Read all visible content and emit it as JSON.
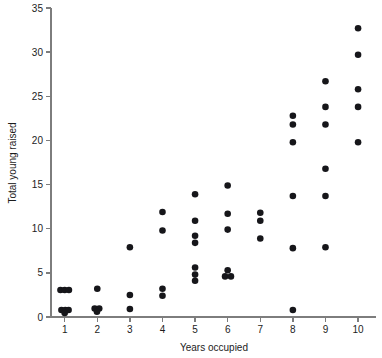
{
  "chart_data": {
    "type": "scatter",
    "title": "",
    "xlabel": "Years occupied",
    "ylabel": "Total young raised",
    "xlim": [
      0.35,
      10.55
    ],
    "ylim": [
      0,
      35
    ],
    "xticks": [
      1,
      2,
      3,
      4,
      5,
      6,
      7,
      8,
      9,
      10
    ],
    "xtick_labels": [
      "1",
      "2",
      "3",
      "4",
      "5",
      "6",
      "7",
      "8",
      "9",
      "10"
    ],
    "yticks": [
      0,
      5,
      10,
      15,
      20,
      25,
      30,
      35
    ],
    "ytick_labels": [
      "0",
      "5",
      "10",
      "15",
      "20",
      "25",
      "30",
      "35"
    ],
    "grid": false,
    "legend": "none",
    "marker": "filled-circle",
    "marker_color": "#16161a",
    "marker_size": 3.3,
    "points": [
      {
        "x": 0.87,
        "y": 3.05
      },
      {
        "x": 1.0,
        "y": 3.05
      },
      {
        "x": 1.13,
        "y": 3.05
      },
      {
        "x": 0.9,
        "y": 0.8
      },
      {
        "x": 1.02,
        "y": 0.8
      },
      {
        "x": 1.12,
        "y": 0.8
      },
      {
        "x": 1.0,
        "y": 0.45
      },
      {
        "x": 2.0,
        "y": 3.2
      },
      {
        "x": 1.92,
        "y": 0.95
      },
      {
        "x": 2.06,
        "y": 0.95
      },
      {
        "x": 1.99,
        "y": 0.6
      },
      {
        "x": 3.0,
        "y": 7.9
      },
      {
        "x": 3.0,
        "y": 2.5
      },
      {
        "x": 3.0,
        "y": 0.9
      },
      {
        "x": 4.0,
        "y": 11.9
      },
      {
        "x": 4.0,
        "y": 9.8
      },
      {
        "x": 4.0,
        "y": 3.2
      },
      {
        "x": 4.0,
        "y": 2.4
      },
      {
        "x": 5.0,
        "y": 13.9
      },
      {
        "x": 5.0,
        "y": 10.9
      },
      {
        "x": 5.0,
        "y": 9.2
      },
      {
        "x": 5.0,
        "y": 8.4
      },
      {
        "x": 5.0,
        "y": 5.6
      },
      {
        "x": 5.0,
        "y": 4.8
      },
      {
        "x": 5.0,
        "y": 4.1
      },
      {
        "x": 6.0,
        "y": 14.9
      },
      {
        "x": 6.0,
        "y": 11.7
      },
      {
        "x": 6.0,
        "y": 9.9
      },
      {
        "x": 6.0,
        "y": 5.3
      },
      {
        "x": 5.92,
        "y": 4.6
      },
      {
        "x": 6.1,
        "y": 4.6
      },
      {
        "x": 7.0,
        "y": 11.8
      },
      {
        "x": 7.0,
        "y": 10.9
      },
      {
        "x": 7.0,
        "y": 8.9
      },
      {
        "x": 8.0,
        "y": 22.8
      },
      {
        "x": 8.0,
        "y": 21.8
      },
      {
        "x": 8.0,
        "y": 19.8
      },
      {
        "x": 8.0,
        "y": 13.7
      },
      {
        "x": 8.0,
        "y": 7.8
      },
      {
        "x": 8.0,
        "y": 0.8
      },
      {
        "x": 9.0,
        "y": 26.7
      },
      {
        "x": 9.0,
        "y": 23.8
      },
      {
        "x": 9.0,
        "y": 21.8
      },
      {
        "x": 9.0,
        "y": 16.8
      },
      {
        "x": 9.0,
        "y": 13.7
      },
      {
        "x": 9.0,
        "y": 7.9
      },
      {
        "x": 10.0,
        "y": 32.7
      },
      {
        "x": 10.0,
        "y": 29.7
      },
      {
        "x": 10.0,
        "y": 25.8
      },
      {
        "x": 10.0,
        "y": 23.8
      },
      {
        "x": 10.0,
        "y": 19.8
      }
    ]
  }
}
